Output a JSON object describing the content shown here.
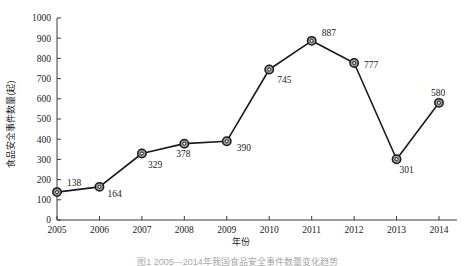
{
  "chart_data": {
    "type": "line",
    "title": "",
    "xlabel": "年份",
    "ylabel": "食品安全事件数量(起)",
    "categories": [
      "2005",
      "2006",
      "2007",
      "2008",
      "2009",
      "2010",
      "2011",
      "2012",
      "2013",
      "2014"
    ],
    "values": [
      138,
      164,
      329,
      378,
      390,
      745,
      887,
      777,
      301,
      580
    ],
    "point_labels": [
      "138",
      "164",
      "329",
      "378",
      "390",
      "745",
      "887",
      "777",
      "301",
      "580"
    ],
    "ylim": [
      0,
      1000
    ],
    "ytick_labels": [
      "0",
      "100",
      "200",
      "300",
      "400",
      "500",
      "600",
      "700",
      "800",
      "900",
      "1000"
    ],
    "ytick_values": [
      0,
      100,
      200,
      300,
      400,
      500,
      600,
      700,
      800,
      900,
      1000
    ],
    "xtick_labels": [
      "2005",
      "2006",
      "2007",
      "2008",
      "2009",
      "2010",
      "2011",
      "2012",
      "2013",
      "2014"
    ],
    "grid": false,
    "legend": "none",
    "series_color": "#1a1a1a",
    "marker_fill": "#9a9a9a",
    "marker_edge": "#1a1a1a",
    "background": "#ffffff"
  },
  "figure": {
    "caption": "图1 2005—2014年我国食品安全事件数量变化趋势"
  }
}
